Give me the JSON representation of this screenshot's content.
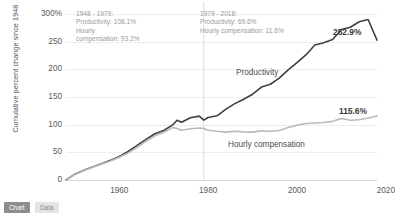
{
  "chart_data": {
    "type": "line",
    "title": "",
    "xlabel": "",
    "ylabel": "Cumulative percent change since 1948",
    "xlim": [
      1948,
      2018
    ],
    "ylim": [
      0,
      300
    ],
    "grid": true,
    "legend": "inline-labels",
    "y_ticks": [
      "0",
      "50",
      "100",
      "150",
      "200",
      "250",
      "300%"
    ],
    "y_tick_values": [
      0,
      50,
      100,
      150,
      200,
      250,
      300
    ],
    "x_ticks": [
      "1960",
      "1980",
      "2000",
      "2020"
    ],
    "x_tick_values": [
      1960,
      1980,
      2000,
      2020
    ],
    "divider_year": 1979,
    "series": [
      {
        "name": "Productivity",
        "color": "#3f3f3f",
        "end_label": "252.9%",
        "end_value": 252.9,
        "x": [
          1948,
          1950,
          1952,
          1954,
          1956,
          1958,
          1960,
          1962,
          1964,
          1966,
          1968,
          1970,
          1972,
          1973,
          1974,
          1976,
          1978,
          1979,
          1980,
          1982,
          1984,
          1986,
          1988,
          1990,
          1992,
          1994,
          1996,
          1998,
          2000,
          2002,
          2004,
          2006,
          2008,
          2010,
          2012,
          2014,
          2016,
          2018
        ],
        "values": [
          0,
          10.5,
          17.5,
          23.5,
          29.5,
          35.5,
          42.5,
          51.5,
          62.5,
          73.5,
          83.5,
          89.5,
          99.5,
          108.1,
          104.5,
          112.5,
          115.5,
          108.1,
          113.0,
          116.0,
          128.0,
          138.0,
          146.0,
          155.0,
          168.0,
          173.0,
          184.0,
          199.0,
          212.0,
          226.0,
          244.0,
          248.0,
          254.0,
          272.0,
          276.0,
          286.0,
          290.0,
          252.9
        ]
      },
      {
        "name": "Hourly compensation",
        "color": "#b9b9b9",
        "end_label": "115.6%",
        "end_value": 115.6,
        "x": [
          1948,
          1950,
          1952,
          1954,
          1956,
          1958,
          1960,
          1962,
          1964,
          1966,
          1968,
          1970,
          1972,
          1973,
          1974,
          1976,
          1978,
          1979,
          1980,
          1982,
          1984,
          1986,
          1988,
          1990,
          1992,
          1994,
          1996,
          1998,
          2000,
          2002,
          2004,
          2006,
          2008,
          2010,
          2012,
          2014,
          2016,
          2018
        ],
        "values": [
          0,
          10.0,
          17.0,
          23.0,
          29.0,
          34.5,
          41.0,
          49.0,
          59.0,
          70.0,
          80.0,
          86.0,
          95.0,
          93.2,
          90.0,
          92.5,
          94.0,
          93.2,
          90.0,
          88.0,
          86.5,
          88.0,
          87.0,
          86.5,
          89.0,
          88.0,
          89.5,
          95.0,
          99.0,
          102.0,
          103.0,
          104.0,
          106.0,
          111.0,
          108.0,
          109.0,
          112.0,
          115.6
        ]
      }
    ],
    "annotations": [
      {
        "id": "period-1948-1979",
        "text": "1948 - 1979:\n Productivity: 108.1%\n Hourly\n compensation: 93.2%"
      },
      {
        "id": "period-1979-2018",
        "text": "1979 - 2018:\n Productivity: 69.6%\n Hourly compensation: 11.6%"
      }
    ]
  },
  "footer": {
    "chart_tab_label": "Chart",
    "data_tab_label": "Data"
  }
}
